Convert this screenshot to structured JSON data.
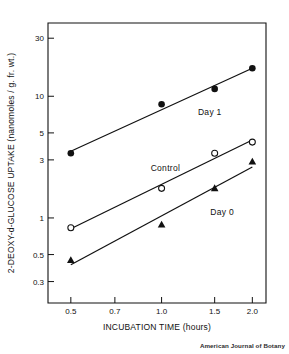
{
  "chart_data": {
    "type": "line",
    "title": "",
    "xlabel": "INCUBATION TIME (hours)",
    "ylabel": "2-DEOXY-d-GLUCOSE UPTAKE (nanomoles / g. fr. wt.)",
    "xscale": "log",
    "yscale": "log",
    "xlim": [
      0.42,
      2.22
    ],
    "ylim": [
      0.2,
      40
    ],
    "grid": false,
    "legend_position": "inline-annotations",
    "xticks": [
      0.5,
      0.7,
      1.0,
      1.5,
      2.0
    ],
    "xtick_labels": [
      "0.5",
      "0.7",
      "1.0",
      "1.5",
      "2.0"
    ],
    "yticks": [
      0.3,
      0.5,
      1,
      3,
      5,
      10,
      30
    ],
    "ytick_labels": [
      "0.3",
      "0.5",
      "1",
      "3",
      "5",
      "10",
      "30"
    ],
    "x": [
      0.5,
      1.0,
      1.5,
      2.0
    ],
    "series": [
      {
        "name": "Day 1",
        "marker": "filled-circle",
        "values": [
          3.4,
          8.6,
          11.5,
          17.0
        ]
      },
      {
        "name": "Control",
        "marker": "open-circle",
        "values": [
          0.83,
          1.75,
          3.4,
          4.2
        ]
      },
      {
        "name": "Day 0",
        "marker": "filled-triangle",
        "values": [
          0.45,
          0.88,
          1.75,
          2.9
        ]
      }
    ],
    "annotations": [
      {
        "text": "Day 1",
        "x": 1.32,
        "y": 7.0
      },
      {
        "text": "Control",
        "x": 0.92,
        "y": 2.45
      },
      {
        "text": "Day 0",
        "x": 1.45,
        "y": 1.05
      }
    ],
    "credit": "American Journal of Botany"
  },
  "axes": {
    "x_axis_title": "INCUBATION TIME (hours)",
    "y_axis_title": "2-DEOXY-d-GLUCOSE UPTAKE (nanomoles / g. fr. wt.)"
  },
  "colors": {
    "ink": "#111111",
    "background": "#ffffff",
    "credit": "#2b2b2b"
  }
}
